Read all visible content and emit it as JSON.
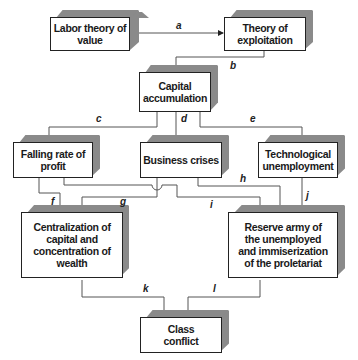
{
  "diagram": {
    "nodes": {
      "labor": "Labor theory of value",
      "exploit": "Theory of exploitation",
      "capital": "Capital accumulation",
      "falling": "Falling rate of profit",
      "crises": "Business crises",
      "tech": "Technological unemployment",
      "central": "Centralization of capital and concentration of wealth",
      "reserve": "Reserve army of the unemployed and immiserization of the proletariat",
      "class": "Class conflict"
    },
    "edges": {
      "a": "a",
      "b": "b",
      "c": "c",
      "d": "d",
      "e": "e",
      "f": "f",
      "g": "g",
      "h": "h",
      "i": "i",
      "j": "j",
      "k": "k",
      "l": "l"
    },
    "colors": {
      "line": "#555555",
      "shadow": "#8a8a8a",
      "border": "#222222"
    }
  }
}
